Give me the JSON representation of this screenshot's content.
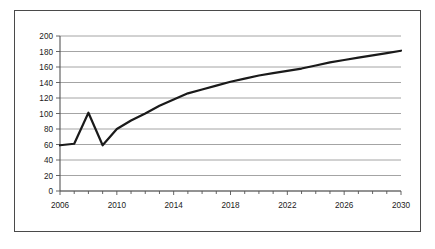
{
  "chart_data": {
    "type": "line",
    "title": "",
    "subtitle": "",
    "xlabel": "",
    "ylabel": "",
    "xlim": [
      2006,
      2030
    ],
    "ylim": [
      0,
      200
    ],
    "grid": "horizontal",
    "legend": "none",
    "y_ticks": [
      0,
      20,
      40,
      60,
      80,
      100,
      120,
      140,
      160,
      180,
      200
    ],
    "y_tick_labels": [
      "0",
      "20",
      "40",
      "60",
      "80",
      "100",
      "120",
      "140",
      "160",
      "180",
      "200"
    ],
    "x_ticks": [
      2006,
      2010,
      2014,
      2018,
      2022,
      2026,
      2030
    ],
    "x_tick_labels": [
      "2006",
      "2010",
      "2014",
      "2018",
      "2022",
      "2026",
      "2030"
    ],
    "x_minor_tick_interval": 1,
    "series": [
      {
        "name": "series-1",
        "color": "#1a1a1a",
        "line_width": 2.2,
        "x": [
          2006,
          2007,
          2008,
          2009,
          2010,
          2011,
          2012,
          2013,
          2014,
          2015,
          2016,
          2017,
          2018,
          2019,
          2020,
          2021,
          2022,
          2023,
          2024,
          2025,
          2026,
          2027,
          2028,
          2029,
          2030
        ],
        "values": [
          59,
          61,
          101,
          59,
          80,
          91,
          100,
          110,
          118,
          126,
          131,
          136,
          141,
          145,
          149,
          152,
          155,
          158,
          162,
          166,
          169,
          172,
          175,
          178,
          181
        ]
      }
    ]
  },
  "colors": {
    "line": "#1a1a1a",
    "grid": "#9a9a9a",
    "axis": "#555555",
    "frame": "#4a4a4a",
    "background": "#ffffff",
    "text": "#1a1a1a"
  }
}
